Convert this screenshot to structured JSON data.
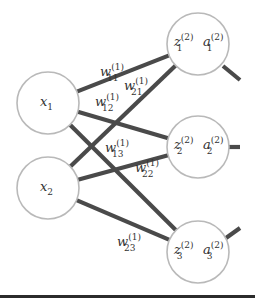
{
  "diagram": {
    "type": "neural-network-layer",
    "colors": {
      "node_stroke": "#b9b9b9",
      "edge": "#4a4a4a",
      "text": "#333333",
      "bottom_rule": "#2b2b2b"
    },
    "input_nodes": [
      {
        "id": "x1",
        "base": "x",
        "sub": "1",
        "cx": 48,
        "cy": 103,
        "r": 31
      },
      {
        "id": "x2",
        "base": "x",
        "sub": "2",
        "cx": 48,
        "cy": 188,
        "r": 31
      }
    ],
    "hidden_nodes": [
      {
        "id": "h1",
        "z_base": "z",
        "z_sub": "1",
        "z_sup": "(2)",
        "a_base": "a",
        "a_sub": "1",
        "a_sup": "(2)",
        "cx": 198,
        "cy": 44,
        "r": 31
      },
      {
        "id": "h2",
        "z_base": "z",
        "z_sub": "2",
        "z_sup": "(2)",
        "a_base": "a",
        "a_sub": "2",
        "a_sup": "(2)",
        "cx": 198,
        "cy": 147,
        "r": 31
      },
      {
        "id": "h3",
        "z_base": "z",
        "z_sub": "3",
        "z_sup": "(2)",
        "a_base": "a",
        "a_sub": "3",
        "a_sup": "(2)",
        "cx": 198,
        "cy": 252,
        "r": 31
      }
    ],
    "weights": [
      {
        "from": "x1",
        "to": "h1",
        "base": "w",
        "sub": "11",
        "sup": "(1)",
        "lx": 100,
        "ly": 76
      },
      {
        "from": "x2",
        "to": "h1",
        "base": "w",
        "sub": "21",
        "sup": "(1)",
        "lx": 124,
        "ly": 90
      },
      {
        "from": "x1",
        "to": "h2",
        "base": "w",
        "sub": "12",
        "sup": "(1)",
        "lx": 95,
        "ly": 106
      },
      {
        "from": "x1",
        "to": "h3",
        "base": "w",
        "sub": "13",
        "sup": "(1)",
        "lx": 105,
        "ly": 152
      },
      {
        "from": "x2",
        "to": "h2",
        "base": "w",
        "sub": "22",
        "sup": "(1)",
        "lx": 135,
        "ly": 172
      },
      {
        "from": "x2",
        "to": "h3",
        "base": "w",
        "sub": "23",
        "sup": "(1)",
        "lx": 117,
        "ly": 246
      }
    ],
    "output_stubs": [
      {
        "from": "h1",
        "x1": 223,
        "y1": 66,
        "x2": 240,
        "y2": 80
      },
      {
        "from": "h2",
        "x1": 229,
        "y1": 147,
        "x2": 240,
        "y2": 147
      },
      {
        "from": "h3",
        "x1": 226,
        "y1": 238,
        "x2": 240,
        "y2": 228
      }
    ]
  }
}
